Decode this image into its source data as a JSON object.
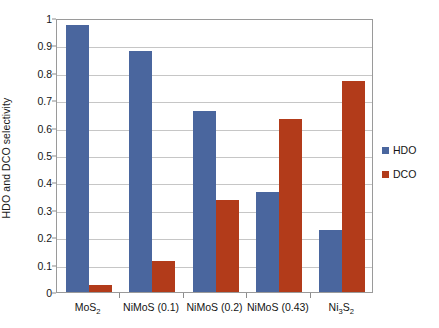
{
  "chart_data": {
    "type": "bar",
    "title": "",
    "subtitle": "",
    "xlabel": "",
    "ylabel": "HDO and DCO selectivity",
    "ylim": [
      0,
      1
    ],
    "ytick_labels": [
      "1",
      "0.9",
      "0.8",
      "0.7",
      "0.6",
      "0.5",
      "0.4",
      "0.3",
      "0.2",
      "0.1",
      "0"
    ],
    "ytick_values": [
      1,
      0.9,
      0.8,
      0.7,
      0.6,
      0.5,
      0.4,
      0.3,
      0.2,
      0.1,
      0
    ],
    "grid": true,
    "grid_axis": "y",
    "legend_position": "right",
    "categories": [
      "MoS2",
      "NiMoS (0.1)",
      "NiMoS (0.2)",
      "NiMoS (0.43)",
      "Ni3S2"
    ],
    "category_labels_html": [
      "MoS<sub>2</sub>",
      "NiMoS (0.1)",
      "NiMoS (0.2)",
      "NiMoS (0.43)",
      "Ni<sub>3</sub>S<sub>2</sub>"
    ],
    "series": [
      {
        "name": "HDO",
        "color": "#4a669e",
        "values": [
          0.975,
          0.88,
          0.66,
          0.365,
          0.225
        ]
      },
      {
        "name": "DCO",
        "color": "#b23b1a",
        "values": [
          0.025,
          0.115,
          0.335,
          0.63,
          0.77
        ]
      }
    ]
  },
  "legend": {
    "items": [
      {
        "label": "HDO",
        "color": "#4a669e"
      },
      {
        "label": "DCO",
        "color": "#b23b1a"
      }
    ]
  },
  "colors": {
    "hdo": "#4a669e",
    "dco": "#b23b1a",
    "grid": "#c6c6c6",
    "frame": "#9a9a9a",
    "text": "#141414",
    "background": "#ffffff"
  }
}
